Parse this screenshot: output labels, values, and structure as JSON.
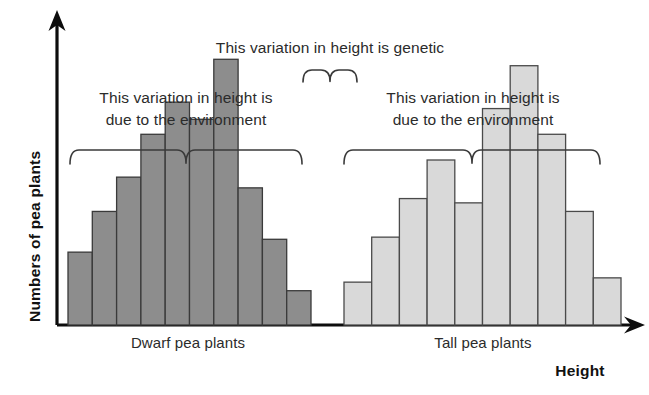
{
  "chart_data": {
    "type": "bar",
    "title": "",
    "xlabel": "Height",
    "ylabel": "Numbers of pea plants",
    "grid": false,
    "legend": false,
    "axis_style": "arrow-axes-no-ticks",
    "annotations": [
      {
        "name": "genetic-annotation",
        "text": "This variation in height is genetic",
        "brace": "down",
        "brace_span_px": [
          303,
          357
        ]
      },
      {
        "name": "dwarf-environment-annotation",
        "text_line1": "This variation in height is",
        "text_line2": "due to the environment",
        "brace": "down",
        "brace_span_px": [
          70,
          302
        ]
      },
      {
        "name": "tall-environment-annotation",
        "text_line1": "This variation in height is",
        "text_line2": "due to the environment",
        "brace": "down",
        "brace_span_px": [
          344,
          600
        ]
      }
    ],
    "groups": [
      {
        "name": "dwarf",
        "category_label": "Dwarf pea plants",
        "color": "#8d8d8d",
        "edge_color": "#3a3a3a",
        "values": [
          34,
          53,
          69,
          89,
          104,
          96,
          124,
          64,
          40,
          16
        ]
      },
      {
        "name": "tall",
        "category_label": "Tall pea plants",
        "color": "#d9d9d9",
        "edge_color": "#4a4a4a",
        "values": [
          20,
          41,
          59,
          77,
          57,
          101,
          121,
          89,
          53,
          22
        ]
      }
    ],
    "ylim": [
      0,
      140
    ],
    "colors": {
      "dwarf_fill": "#8d8d8d",
      "tall_fill": "#d9d9d9",
      "bar_edge": "#3f3f3f",
      "axis": "#0d0d0d",
      "text": "#2b2b2b"
    }
  },
  "axes": {
    "y_label": "Numbers of pea plants",
    "x_label": "Height"
  },
  "categories": {
    "dwarf": "Dwarf pea plants",
    "tall": "Tall pea plants"
  },
  "annotations": {
    "genetic": "This variation in height is genetic",
    "env_line1": "This variation in height is",
    "env_line2": "due to the environment"
  }
}
